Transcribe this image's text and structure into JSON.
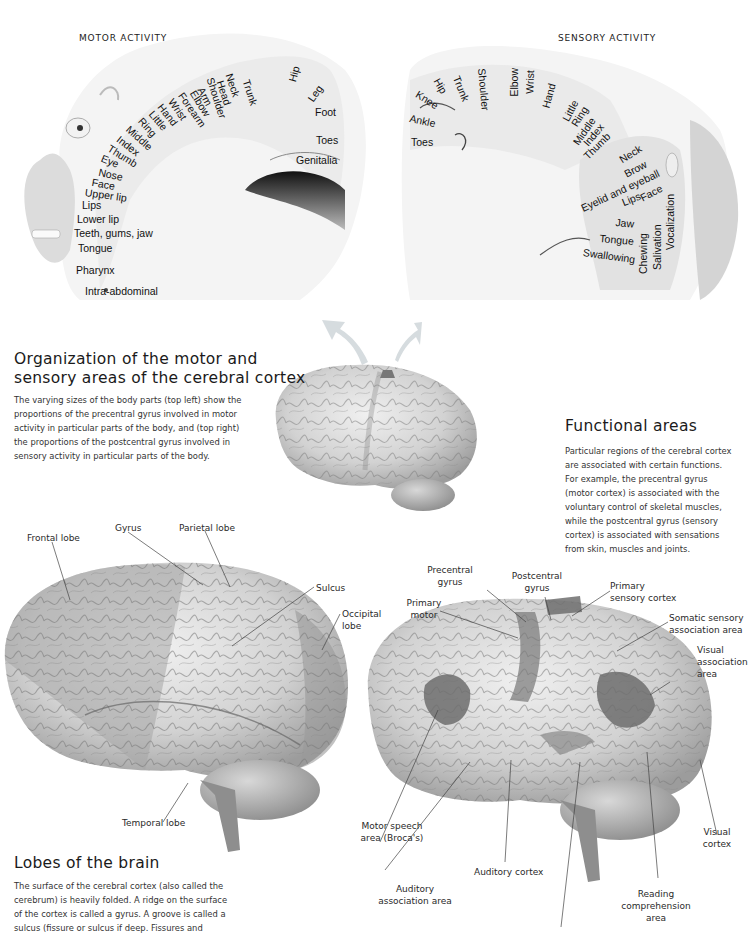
{
  "motor_panel": {
    "heading": "MOTOR ACTIVITY",
    "labels": [
      "Trunk",
      "Hip",
      "Leg",
      "Neck",
      "Head",
      "Shoulder",
      "Arm",
      "Elbow",
      "Forearm",
      "Wrist",
      "Hand",
      "Little",
      "Ring",
      "Middle",
      "Index",
      "Thumb",
      "Eye",
      "Nose",
      "Face",
      "Upper lip",
      "Lips",
      "Lower lip",
      "Teeth, gums, jaw",
      "Tongue",
      "Pharynx",
      "Intra-abdominal",
      "Foot",
      "Toes",
      "Genitalia"
    ]
  },
  "sensory_panel": {
    "heading": "SENSORY ACTIVITY",
    "labels": [
      "Hip",
      "Knee",
      "Trunk",
      "Shoulder",
      "Elbow",
      "Wrist",
      "Hand",
      "Little",
      "Ring",
      "Middle",
      "Index",
      "Thumb",
      "Ankle",
      "Toes",
      "Neck",
      "Brow",
      "Eyelid and eyeball",
      "Face",
      "Lips",
      "Jaw",
      "Tongue",
      "Swallowing",
      "Chewing",
      "Salivation",
      "Vocalization"
    ]
  },
  "organization": {
    "title_line1": "Organization of the motor and",
    "title_line2": "sensory areas of the cerebral cortex",
    "body": [
      "The varying sizes of the body parts (top left) show the",
      "proportions of the precentral gyrus involved in motor",
      "activity in particular parts of the body, and (top right)",
      "the proportions of the postcentral gyrus involved in",
      "sensory activity in particular parts of the body."
    ]
  },
  "functional_areas": {
    "title": "Functional areas",
    "body": [
      "Particular regions of the cerebral cortex",
      "are associated with certain functions.",
      "For example, the precentral gyrus",
      "(motor cortex) is associated with the",
      "voluntary control of skeletal muscles,",
      "while the postcentral gyrus (sensory",
      "cortex) is associated with sensations",
      "from skin, muscles and joints."
    ],
    "labels": {
      "precentral": [
        "Precentral",
        "gyrus"
      ],
      "postcentral": [
        "Postcentral",
        "gyrus"
      ],
      "primary_motor": [
        "Primary",
        "motor"
      ],
      "primary_sensory": [
        "Primary",
        "sensory cortex"
      ],
      "somatic": [
        "Somatic sensory",
        "association area"
      ],
      "visual_assoc": [
        "Visual",
        "association",
        "area"
      ],
      "broca": [
        "Motor speech",
        "area (Broca's)"
      ],
      "auditory_cortex": "Auditory cortex",
      "auditory_assoc": [
        "Auditory",
        "association area"
      ],
      "reading": [
        "Reading",
        "comprehension",
        "area"
      ],
      "visual_cortex": [
        "Visual",
        "cortex"
      ]
    }
  },
  "lobes": {
    "title": "Lobes of the brain",
    "body": [
      "The surface of the cerebral cortex (also called the",
      "cerebrum) is heavily folded. A ridge on the surface",
      "of the cortex is called a gyrus. A groove is called a",
      "sulcus (fissure or sulcus if deep. Fissures and"
    ],
    "labels": {
      "frontal": "Frontal lobe",
      "gyrus": "Gyrus",
      "parietal": "Parietal lobe",
      "sulcus": "Sulcus",
      "occipital": [
        "Occipital",
        "lobe"
      ],
      "temporal": "Temporal lobe"
    }
  },
  "colors": {
    "brain_light": "#e6e6e6",
    "brain_mid": "#bdbdbd",
    "brain_dark": "#8a8a8a",
    "highlight": "#7d7d7d",
    "arrow": "#d8dde0"
  }
}
